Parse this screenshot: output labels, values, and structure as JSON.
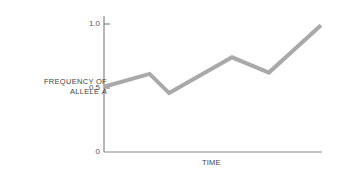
{
  "chart_data": {
    "type": "line",
    "title": "",
    "xlabel": "TIME",
    "ylabel_line1": "FREQUENCY OF",
    "ylabel_line2": "ALLELE",
    "ylabel_italic": "A",
    "ylim": [
      0,
      1.0
    ],
    "yticks": [
      "0",
      "0.5",
      "1.0"
    ],
    "xticks": [],
    "grid": false,
    "legend": null,
    "series": [
      {
        "name": "Frequency of allele A",
        "color": "#a9a9a9",
        "x": [
          0,
          0.21,
          0.3,
          0.59,
          0.76,
          1.0
        ],
        "values": [
          0.51,
          0.61,
          0.46,
          0.74,
          0.62,
          0.99
        ]
      }
    ]
  }
}
